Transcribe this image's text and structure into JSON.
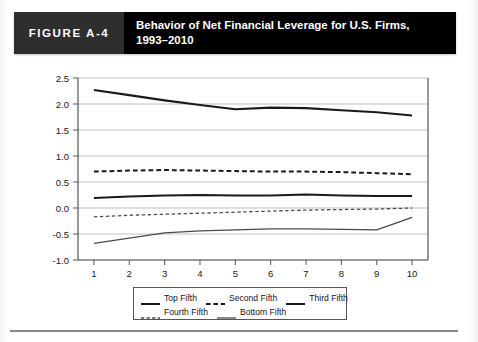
{
  "header": {
    "figure_number": "FIGURE A-4",
    "title_line1": "Behavior of Net Financial Leverage for U.S. Firms,",
    "title_line2": "1993–2010",
    "number_block_color": "#2e2e2e",
    "title_block_color": "#000000",
    "text_color": "#ffffff"
  },
  "legend": {
    "rows": [
      [
        {
          "label": "Top Fifth",
          "style": "solid-bold",
          "color": "#1a1a1a"
        },
        {
          "label": "Second Fifth",
          "style": "dashed-bold",
          "color": "#1a1a1a"
        },
        {
          "label": "Third Fifth",
          "style": "solid-bold",
          "color": "#1a1a1a"
        }
      ],
      [
        {
          "label": "Fourth Fifth",
          "style": "dashed-thin",
          "color": "#4a4a4a"
        },
        {
          "label": "Bottom Fifth",
          "style": "solid-thin",
          "color": "#4a4a4a"
        }
      ]
    ]
  },
  "chart_data": {
    "type": "line",
    "title": "Behavior of Net Financial Leverage for U.S. Firms, 1993–2010",
    "xlabel": "",
    "ylabel": "",
    "x": [
      1,
      2,
      3,
      4,
      5,
      6,
      7,
      8,
      9,
      10
    ],
    "xtick_labels": [
      "1",
      "2",
      "3",
      "4",
      "5",
      "6",
      "7",
      "8",
      "9",
      "10"
    ],
    "xlim": [
      0.55,
      10.45
    ],
    "ylim": [
      -1.0,
      2.5
    ],
    "ytick_labels": [
      "2.5",
      "2.0",
      "1.5",
      "1.0",
      "0.5",
      "0.0",
      "-0.5",
      "-1.0"
    ],
    "yticks": [
      2.5,
      2.0,
      1.5,
      1.0,
      0.5,
      0.0,
      -0.5,
      -1.0
    ],
    "grid": "horizontal",
    "grid_color": "#b9b9b9",
    "axis_color": "#555555",
    "legend_position": "below-plot",
    "series": [
      {
        "name": "Top Fifth",
        "style": "solid-bold",
        "color": "#1a1a1a",
        "width": 2.1,
        "values": [
          2.27,
          2.17,
          2.07,
          1.98,
          1.9,
          1.93,
          1.92,
          1.88,
          1.84,
          1.78
        ]
      },
      {
        "name": "Second Fifth",
        "style": "dashed-bold",
        "color": "#1a1a1a",
        "width": 2.0,
        "values": [
          0.7,
          0.72,
          0.73,
          0.72,
          0.71,
          0.7,
          0.7,
          0.69,
          0.67,
          0.65
        ]
      },
      {
        "name": "Third Fifth",
        "style": "solid-bold",
        "color": "#1a1a1a",
        "width": 2.0,
        "values": [
          0.19,
          0.22,
          0.24,
          0.25,
          0.24,
          0.24,
          0.26,
          0.24,
          0.23,
          0.23
        ]
      },
      {
        "name": "Fourth Fifth",
        "style": "dashed-thin",
        "color": "#4a4a4a",
        "width": 1.3,
        "values": [
          -0.17,
          -0.14,
          -0.12,
          -0.1,
          -0.08,
          -0.06,
          -0.04,
          -0.03,
          -0.02,
          0.0
        ]
      },
      {
        "name": "Bottom Fifth",
        "style": "solid-thin",
        "color": "#4a4a4a",
        "width": 1.3,
        "values": [
          -0.68,
          -0.58,
          -0.48,
          -0.44,
          -0.42,
          -0.4,
          -0.4,
          -0.41,
          -0.42,
          -0.18
        ]
      }
    ]
  }
}
